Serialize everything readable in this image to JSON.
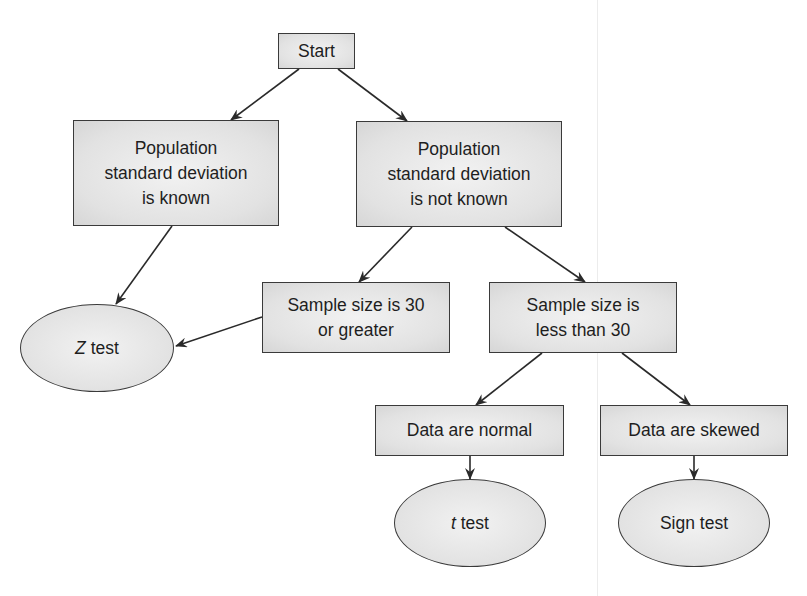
{
  "diagram": {
    "type": "flowchart",
    "colors": {
      "node_fill": "#e4e4e4",
      "node_border": "#3a3a3a",
      "edge": "#2a2a2a",
      "text": "#1e1e1e",
      "background": "#ffffff"
    },
    "nodes": {
      "start": {
        "label": "Start",
        "shape": "rectangle"
      },
      "sd_known": {
        "label": "Population\nstandard deviation\nis known",
        "shape": "rectangle"
      },
      "sd_unknown": {
        "label": "Population\nstandard deviation\nis not known",
        "shape": "rectangle"
      },
      "n_ge_30": {
        "label": "Sample size is 30\nor greater",
        "shape": "rectangle"
      },
      "n_lt_30": {
        "label": "Sample size is\nless than 30",
        "shape": "rectangle"
      },
      "data_normal": {
        "label": "Data are normal",
        "shape": "rectangle"
      },
      "data_skewed": {
        "label": "Data are skewed",
        "shape": "rectangle"
      },
      "z_test": {
        "label_italic": "Z",
        "label_rest": " test",
        "shape": "ellipse"
      },
      "t_test": {
        "label_italic": "t",
        "label_rest": " test",
        "shape": "ellipse"
      },
      "sign_test": {
        "label": "Sign test",
        "shape": "ellipse"
      }
    },
    "edges": [
      {
        "from": "start",
        "to": "sd_known"
      },
      {
        "from": "start",
        "to": "sd_unknown"
      },
      {
        "from": "sd_known",
        "to": "z_test"
      },
      {
        "from": "sd_unknown",
        "to": "n_ge_30"
      },
      {
        "from": "sd_unknown",
        "to": "n_lt_30"
      },
      {
        "from": "n_ge_30",
        "to": "z_test"
      },
      {
        "from": "n_lt_30",
        "to": "data_normal"
      },
      {
        "from": "n_lt_30",
        "to": "data_skewed"
      },
      {
        "from": "data_normal",
        "to": "t_test"
      },
      {
        "from": "data_skewed",
        "to": "sign_test"
      }
    ]
  }
}
